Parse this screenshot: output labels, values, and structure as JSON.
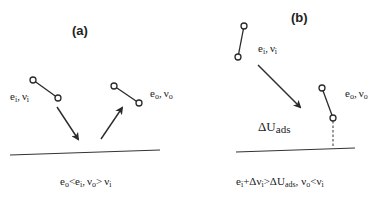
{
  "figure": {
    "panel_a": {
      "label": "(a)",
      "incoming": {
        "e": "e",
        "e_sub": "i",
        "sep": ",",
        "nu": "ν",
        "nu_sub": "i"
      },
      "outgoing": {
        "e": "e",
        "e_sub": "o",
        "sep": ",",
        "nu": "ν",
        "nu_sub": "o"
      },
      "caption": {
        "e_o": "e",
        "e_o_sub": "o",
        "lt": "<",
        "e_i": "e",
        "e_i_sub": "i",
        "sep": ",",
        "nu_o": "ν",
        "nu_o_sub": "o",
        "gt": ">",
        "nu_i": "ν",
        "nu_i_sub": "i"
      }
    },
    "panel_b": {
      "label": "(b)",
      "incoming": {
        "e": "e",
        "e_sub": "i",
        "sep": ",",
        "nu": "ν",
        "nu_sub": "i"
      },
      "outgoing": {
        "e": "e",
        "e_sub": "o",
        "sep": ",",
        "nu": "ν",
        "nu_sub": "o"
      },
      "adsorption": {
        "delta_u": "ΔU",
        "sub": "ads"
      },
      "caption": {
        "e_i": "e",
        "e_i_sub": "i",
        "plus": "+Δν",
        "plus_sub": "i",
        "gt": ">",
        "delta_u": "ΔU",
        "delta_sub": "ads",
        "sep": ",",
        "nu_o": "ν",
        "nu_o_sub": "o",
        "lt": "<",
        "nu_i": "ν",
        "nu_i_sub": "i"
      }
    },
    "colors": {
      "ink": "#2a2a2a",
      "background": "#ffffff"
    }
  }
}
